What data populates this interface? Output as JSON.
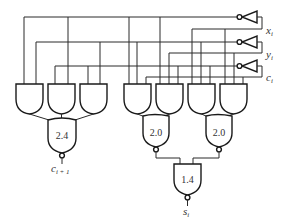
{
  "diagram": {
    "title": "",
    "inputs": [
      {
        "name": "x",
        "subscript": "i"
      },
      {
        "name": "y",
        "subscript": "i"
      },
      {
        "name": "c",
        "subscript": "i"
      }
    ],
    "outputs": {
      "carry": {
        "name": "c",
        "subscript": "i + 1"
      },
      "sum": {
        "name": "s",
        "subscript": "i"
      }
    },
    "gates": {
      "carry_out_gate": "2.4",
      "sum_left_gate": "2.0",
      "sum_right_gate": "2.0",
      "sum_final_gate": "1.4"
    },
    "stroke_color": "#2a2a2a",
    "background": "#ffffff"
  }
}
